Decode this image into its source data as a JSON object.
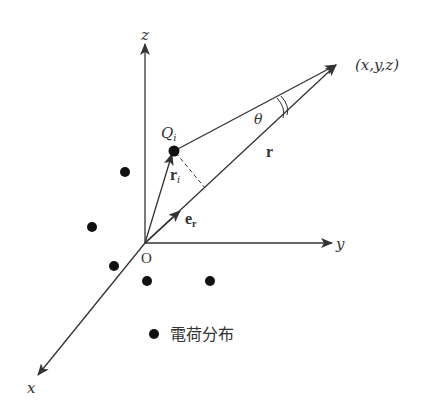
{
  "diagram": {
    "type": "3d-coordinate-vector-diagram",
    "axes": {
      "x_label": "x",
      "y_label": "y",
      "z_label": "z",
      "origin_label": "O"
    },
    "point_label": "(x,y,z)",
    "charge_label": "Q",
    "charge_subscript": "i",
    "vector_r_label": "r",
    "vector_ri_label": "r",
    "vector_ri_subscript": "i",
    "unit_vector_label": "e",
    "unit_vector_subscript": "r",
    "angle_label": "θ",
    "legend": {
      "marker": "dot",
      "label": "電荷分布"
    },
    "colors": {
      "line": "#333333",
      "dot": "#111111",
      "background": "#ffffff"
    }
  }
}
